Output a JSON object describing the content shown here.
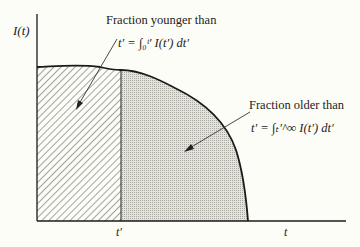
{
  "diagram": {
    "y_axis_label": "I(t)",
    "x_tick_label": "t′",
    "x_axis_label": "t",
    "left_region": {
      "caption": "Fraction younger than",
      "formula": "t′ = ∫₀ᵗ′ I(t′) dt′",
      "fill": "diagonal hatch"
    },
    "right_region": {
      "caption": "Fraction older than",
      "formula": "t′ = ∫ₜ′^∞ I(t′) dt′",
      "fill": "stipple gray"
    },
    "colors": {
      "line": "#1a1a1a",
      "stipple": "#cfcfc8",
      "background": "#fdfdf7"
    }
  }
}
